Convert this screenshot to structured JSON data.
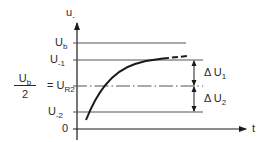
{
  "diagram": {
    "axes": {
      "y_label": "u",
      "y_label_sub": "-",
      "x_label": "t"
    },
    "levels": {
      "ub": {
        "main": "U",
        "sub": "b"
      },
      "u_minus1": {
        "main": "U",
        "sub": "-1"
      },
      "ur2": {
        "main": "U",
        "sub": "R2"
      },
      "u_minus2": {
        "main": "U",
        "sub": "-2"
      },
      "zero": "0"
    },
    "fraction": {
      "numerator_main": "U",
      "numerator_sub": "b",
      "denominator": "2",
      "equals": "="
    },
    "dimensions": {
      "delta_u1": {
        "symbol": "Δ",
        "main": "U",
        "sub": "1"
      },
      "delta_u2": {
        "symbol": "Δ",
        "main": "U",
        "sub": "2"
      }
    },
    "colors": {
      "lines": "#2a2a2a",
      "level_lines": "#555555",
      "curve": "#1a1a1a"
    }
  }
}
